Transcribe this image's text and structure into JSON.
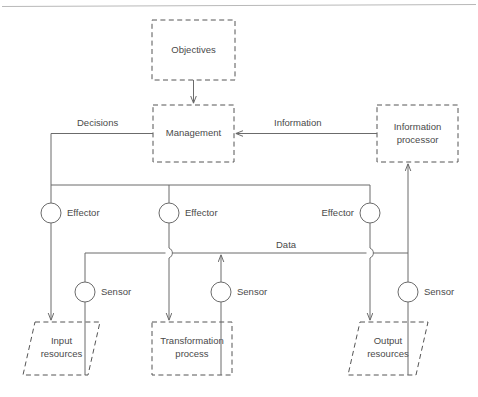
{
  "diagram": {
    "colors": {
      "shape_stroke": "#555555",
      "connector_stroke": "#6b6b6b",
      "text": "#4a4a4a",
      "rule": "#b9b9b9",
      "background": "#ffffff"
    },
    "nodes": [
      {
        "id": "objectives",
        "label": "Objectives",
        "shape": "rect-dashed",
        "x": 152,
        "y": 20,
        "w": 83,
        "h": 60
      },
      {
        "id": "management",
        "label": "Management",
        "shape": "rect-dashed",
        "x": 153,
        "y": 105,
        "w": 81,
        "h": 57
      },
      {
        "id": "information-processor",
        "label_line1": "Information",
        "label_line2": "processor",
        "shape": "rect-dashed",
        "x": 377,
        "y": 105,
        "w": 81,
        "h": 57
      },
      {
        "id": "input-resources",
        "label_line1": "Input",
        "label_line2": "resources",
        "shape": "parallelogram-dashed",
        "x": 23,
        "y": 322,
        "w": 77,
        "h": 53
      },
      {
        "id": "transformation-process",
        "label_line1": "Transformation",
        "label_line2": "process",
        "shape": "rect-dashed",
        "x": 152,
        "y": 322,
        "w": 80,
        "h": 53
      },
      {
        "id": "output-resources",
        "label_line1": "Output",
        "label_line2": "resources",
        "shape": "parallelogram-dashed",
        "x": 348,
        "y": 322,
        "w": 80,
        "h": 53
      }
    ],
    "effectors": [
      {
        "id": "effector-1",
        "label": "Effector",
        "cx": 51,
        "cy": 213,
        "r": 10,
        "label_side": "right"
      },
      {
        "id": "effector-2",
        "label": "Effector",
        "cx": 169,
        "cy": 213,
        "r": 10,
        "label_side": "right"
      },
      {
        "id": "effector-3",
        "label": "Effector",
        "cx": 370,
        "cy": 213,
        "r": 10,
        "label_side": "left"
      }
    ],
    "sensors": [
      {
        "id": "sensor-1",
        "label": "Sensor",
        "cx": 85,
        "cy": 292,
        "r": 10,
        "label_side": "right"
      },
      {
        "id": "sensor-2",
        "label": "Sensor",
        "cx": 221,
        "cy": 292,
        "r": 10,
        "label_side": "right"
      },
      {
        "id": "sensor-3",
        "label": "Sensor",
        "cx": 408,
        "cy": 292,
        "r": 10,
        "label_side": "right"
      }
    ],
    "edge_labels": [
      {
        "id": "decisions-label",
        "text": "Decisions",
        "x": 77,
        "y": 123
      },
      {
        "id": "information-label",
        "text": "Information",
        "x": 274,
        "y": 123
      },
      {
        "id": "data-label",
        "text": "Data",
        "x": 276,
        "y": 245
      }
    ],
    "connections": [
      {
        "id": "objectives-to-management",
        "from": "objectives",
        "to": "management",
        "arrow": true
      },
      {
        "id": "information-processor-to-management",
        "from": "information-processor",
        "to": "management",
        "arrow": true,
        "label": "Information"
      },
      {
        "id": "management-to-effector-bus",
        "from": "management",
        "to": "effector-bus",
        "arrow": false,
        "label": "Decisions"
      },
      {
        "id": "effector-1-to-input-resources",
        "from": "effector-1",
        "to": "input-resources",
        "arrow": true
      },
      {
        "id": "effector-2-to-transformation-process",
        "from": "effector-2",
        "to": "transformation-process",
        "arrow": true
      },
      {
        "id": "effector-3-to-output-resources",
        "from": "effector-3",
        "to": "output-resources",
        "arrow": true
      },
      {
        "id": "sensor-1-to-data-bus",
        "from": "input-resources",
        "to": "data-bus",
        "arrow": false
      },
      {
        "id": "sensor-2-to-data-bus",
        "from": "transformation-process",
        "to": "data-bus",
        "arrow": true
      },
      {
        "id": "sensor-3-to-data-bus",
        "from": "output-resources",
        "to": "data-bus",
        "arrow": false
      },
      {
        "id": "data-bus-to-information-processor",
        "from": "data-bus",
        "to": "information-processor",
        "arrow": true,
        "label": "Data"
      }
    ]
  }
}
